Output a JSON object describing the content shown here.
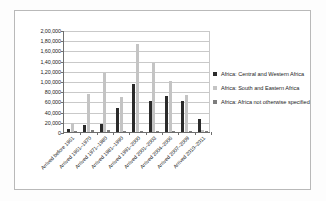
{
  "chart_data": {
    "type": "bar",
    "title": "",
    "subtitle": "",
    "xlabel": "",
    "ylabel": "",
    "ylim": [
      0,
      200000
    ],
    "ytick_step": 20000,
    "grid": true,
    "legend_position": "right",
    "number_format": "indian-lakh",
    "categories": [
      "Arrived before 1961",
      "Arrived 1961–1970",
      "Arrived 1971–1980",
      "Arrived 1981–1990",
      "Arrived 1991–2000",
      "Arrived 2001–2003",
      "Arrived 2004–2006",
      "Arrived 2007–2009",
      "Arrived 2010–2011"
    ],
    "ytick_labels": [
      "2,00,000",
      "1,80,000",
      "1,60,000",
      "1,40,000",
      "1,20,000",
      "1,00,000",
      "80,000",
      "60,000",
      "40,000",
      "20,000",
      "0"
    ],
    "ytick_values": [
      200000,
      180000,
      160000,
      140000,
      120000,
      100000,
      80000,
      60000,
      40000,
      20000,
      0
    ],
    "series": [
      {
        "name": "Africa: Central and Western Africa",
        "color": "#2b2b2b",
        "values": [
          5000,
          14000,
          15000,
          48000,
          94000,
          61000,
          70000,
          60000,
          25000
        ]
      },
      {
        "name": "Africa: South and Eastern Africa",
        "color": "#c4c4c4",
        "values": [
          18000,
          75000,
          116000,
          69000,
          172000,
          136000,
          100000,
          72000,
          3000
        ]
      },
      {
        "name": "Africa: Africa not otherwise specified",
        "color": "#7d7d7d",
        "values": [
          1000,
          3000,
          4000,
          2000,
          2000,
          2000,
          2000,
          1000,
          1000
        ]
      }
    ]
  },
  "legend": {
    "items": [
      {
        "label": "Africa: Central and Western Africa"
      },
      {
        "label": "Africa: South and Eastern Africa"
      },
      {
        "label": "Africa: Africa not otherwise specified"
      }
    ]
  }
}
